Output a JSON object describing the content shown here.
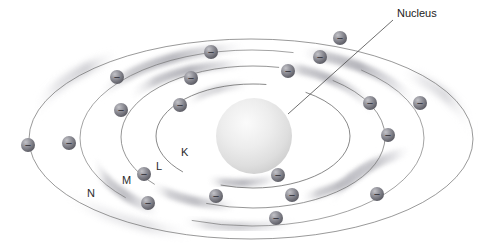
{
  "figure": {
    "type": "bohr-atomic-model-diagram",
    "title": "",
    "background_color": "#ffffff",
    "width": 491,
    "height": 247
  },
  "nucleus": {
    "label": "Nucleus",
    "label_x": 397,
    "label_y": 17,
    "center_x": 254,
    "center_y": 136,
    "radius": 38,
    "fill_light": "#f4f4f4",
    "fill_dark": "#cfcfcf",
    "leader_line": {
      "x1": 393,
      "y1": 20,
      "x2": 288,
      "y2": 114
    }
  },
  "shells": [
    {
      "name": "K",
      "label": "K",
      "label_x": 181,
      "label_y": 156,
      "rx": 97,
      "ry": 52,
      "electron_count": 2
    },
    {
      "name": "L",
      "label": "L",
      "label_x": 156,
      "label_y": 170,
      "rx": 132,
      "ry": 71,
      "electron_count": 8
    },
    {
      "name": "M",
      "label": "M",
      "label_x": 122,
      "label_y": 184,
      "rx": 172,
      "ry": 88,
      "electron_count": 7
    },
    {
      "name": "N",
      "label": "N",
      "label_x": 87,
      "label_y": 197,
      "rx": 222,
      "ry": 100,
      "electron_count": 6
    }
  ],
  "electrons": {
    "symbol": "−",
    "radius": 7,
    "fill_light": "#b6b6bb",
    "fill_dark": "#5e5e66",
    "positions": [
      {
        "shell": "K",
        "x": 180,
        "y": 105
      },
      {
        "shell": "K",
        "x": 278,
        "y": 175
      },
      {
        "shell": "L",
        "x": 191,
        "y": 78
      },
      {
        "shell": "L",
        "x": 288,
        "y": 71
      },
      {
        "shell": "L",
        "x": 370,
        "y": 103
      },
      {
        "shell": "L",
        "x": 292,
        "y": 195
      },
      {
        "shell": "L",
        "x": 216,
        "y": 196
      },
      {
        "shell": "L",
        "x": 144,
        "y": 174
      },
      {
        "shell": "L",
        "x": 121,
        "y": 110
      },
      {
        "shell": "L",
        "x": 320,
        "y": 57
      },
      {
        "shell": "M",
        "x": 117,
        "y": 77
      },
      {
        "shell": "M",
        "x": 211,
        "y": 52
      },
      {
        "shell": "M",
        "x": 340,
        "y": 38
      },
      {
        "shell": "M",
        "x": 388,
        "y": 135
      },
      {
        "shell": "M",
        "x": 377,
        "y": 194
      },
      {
        "shell": "M",
        "x": 276,
        "y": 218
      },
      {
        "shell": "M",
        "x": 148,
        "y": 203
      },
      {
        "shell": "N",
        "x": 28,
        "y": 145
      },
      {
        "shell": "N",
        "x": 69,
        "y": 143
      },
      {
        "shell": "N",
        "x": 420,
        "y": 103
      }
    ]
  },
  "colors": {
    "orbit_stroke": "#6d6d6d",
    "glow": "#c8c8cc",
    "text": "#1c1c1c"
  }
}
